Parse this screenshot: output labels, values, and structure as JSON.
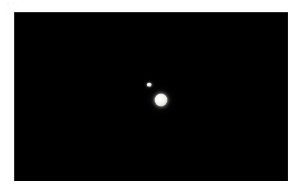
{
  "page": {
    "background_color": "#ffffff",
    "width": 302,
    "height": 195
  },
  "artifact": {
    "name": "scan-speckle",
    "color": "#c6c6c6"
  },
  "sky_frame": {
    "background_color": "#000000",
    "border_color": "#787878",
    "left": 14,
    "top": 12,
    "width": 274,
    "height": 169
  },
  "objects": [
    {
      "id": "primary",
      "label": "",
      "center_x": 147,
      "center_y": 88,
      "diameter": 13,
      "color": "#f7f6f3",
      "brightness": "bright"
    },
    {
      "id": "companion",
      "label": "",
      "center_x": 135,
      "center_y": 72.5,
      "diameter": 4.5,
      "color": "#f0efec",
      "brightness": "faint"
    }
  ]
}
